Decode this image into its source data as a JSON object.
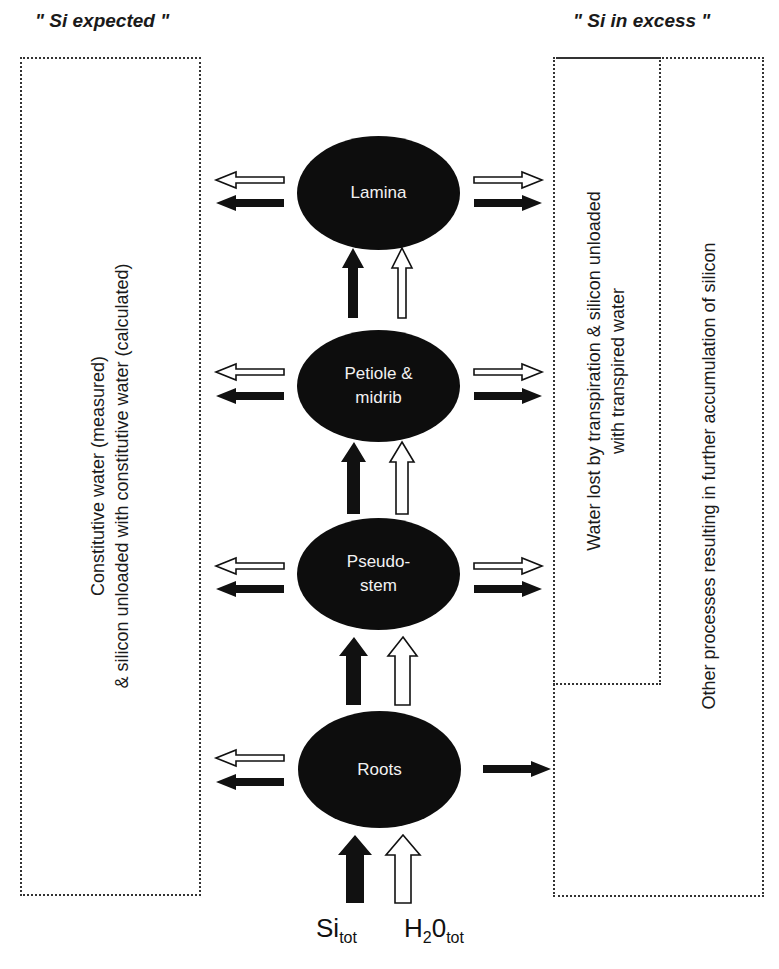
{
  "titles": {
    "left": "\" Si expected \"",
    "right": "\" Si in excess \""
  },
  "boxes": {
    "left": {
      "line1": "Constitutive water (measured)",
      "line2": "& silicon unloaded with constitutive water (calculated)"
    },
    "right_inner": {
      "line1": "Water lost by transpiration & silicon unloaded",
      "line2": "with transpired water"
    },
    "right_outer": {
      "line1": "Other processes resulting in further accumulation of silicon"
    }
  },
  "nodes": [
    {
      "id": "lamina",
      "line1": "Lamina",
      "line2": ""
    },
    {
      "id": "petiole",
      "line1": "Petiole &",
      "line2": "midrib"
    },
    {
      "id": "pseudostem",
      "line1": "Pseudo-",
      "line2": "stem"
    },
    {
      "id": "roots",
      "line1": "Roots",
      "line2": ""
    }
  ],
  "inputs": {
    "si": {
      "base": "Si",
      "sub": "tot"
    },
    "water": {
      "base": "H",
      "sub2": "2",
      "base2": "0",
      "sub": "tot"
    }
  },
  "colors": {
    "node_fill": "#0d0d0d",
    "silicon_arrow": "#111111",
    "water_arrow": "#ffffff",
    "box_border": "#333333"
  }
}
